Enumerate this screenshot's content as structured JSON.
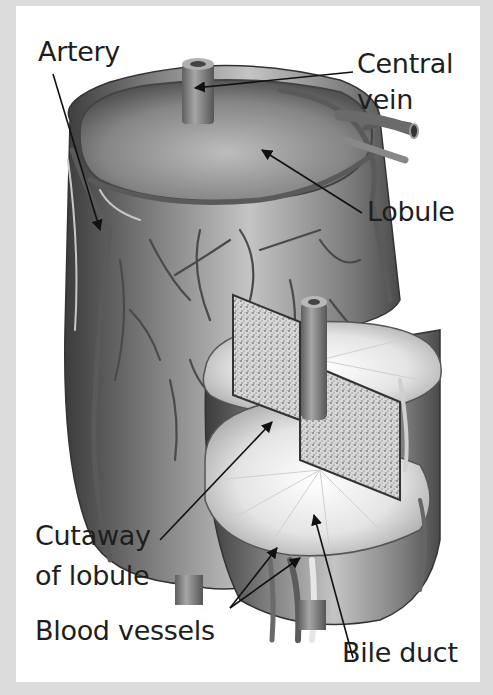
{
  "diagram": {
    "colors": {
      "background": "#dcdcdc",
      "panel": "#ffffff",
      "text": "#1e1e1e",
      "tissue": "#8a8a8a",
      "vessel": "#6e6e6e"
    },
    "labels": {
      "artery": "Artery",
      "central_vein_line1": "Central",
      "central_vein_line2": "vein",
      "lobule": "Lobule",
      "cutaway_line1": "Cutaway",
      "cutaway_line2": "of lobule",
      "blood_vessels": "Blood vessels",
      "bile_duct": "Bile duct"
    }
  }
}
